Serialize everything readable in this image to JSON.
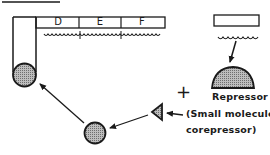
{
  "diagram": {
    "type": "biology-schematic",
    "topic": "gene repression by repressor and corepressor",
    "genes": [
      {
        "label": "D"
      },
      {
        "label": "E"
      },
      {
        "label": "F"
      }
    ],
    "labels": {
      "repressor": "Repressor",
      "plus": "+",
      "corepressor_line1": "(Small molecule",
      "corepressor_line2": "corepressor)"
    },
    "colors": {
      "stroke": "#1a1a1a",
      "shade": "#9a9a9a",
      "background": "#ffffff"
    }
  }
}
